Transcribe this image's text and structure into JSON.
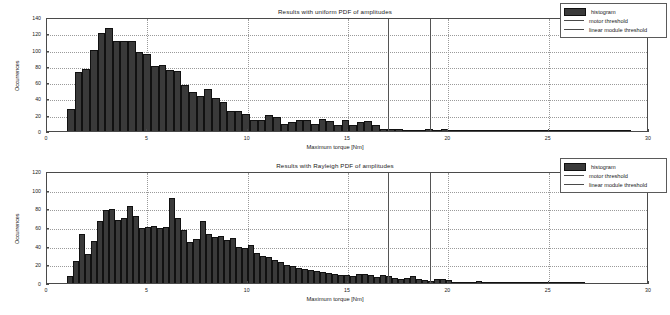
{
  "figure": {
    "background": "#ffffff",
    "bar_color": "#3a3a3a",
    "threshold_color": "#555555",
    "grid_color": "#9a9a9a"
  },
  "charts": [
    {
      "id": "uniform",
      "title": "Results with uniform PDF of amplitudes",
      "xlabel": "Maximum torque [Nm]",
      "ylabel": "Occurrences",
      "xlim": [
        0,
        30
      ],
      "ylim": [
        0,
        140
      ],
      "xticks": [
        0,
        5,
        10,
        15,
        20,
        25,
        30
      ],
      "yticks": [
        0,
        20,
        40,
        60,
        80,
        100,
        120,
        140
      ],
      "grid": true,
      "legend": [
        {
          "label": "histogram",
          "style": "box"
        },
        {
          "label": "motor threshold",
          "style": "line"
        },
        {
          "label": "linear module threshold",
          "style": "line"
        }
      ],
      "thresholds": [
        {
          "name": "motor threshold",
          "value": 17.0
        },
        {
          "name": "linear module threshold",
          "value": 19.1
        }
      ],
      "bin_width": 0.38,
      "bin_start": 1.0,
      "values": [
        27,
        72,
        76,
        99,
        120,
        127,
        111,
        111,
        110,
        97,
        94,
        80,
        81,
        75,
        74,
        57,
        48,
        43,
        51,
        40,
        36,
        25,
        25,
        21,
        14,
        13,
        20,
        17,
        9,
        11,
        14,
        13,
        9,
        15,
        12,
        7,
        13,
        8,
        11,
        12,
        7,
        2,
        2,
        3,
        1,
        1,
        1,
        3,
        1,
        2,
        1,
        1,
        1,
        1,
        1,
        1,
        1,
        1,
        1,
        1,
        1,
        1,
        1,
        1,
        1,
        1,
        1,
        1,
        1,
        1,
        1,
        1,
        1,
        1
      ]
    },
    {
      "id": "rayleigh",
      "title": "Results with Rayleigh PDF of amplitudes",
      "xlabel": "Maximum torque [Nm]",
      "ylabel": "Occurrences",
      "xlim": [
        0,
        30
      ],
      "ylim": [
        0,
        120
      ],
      "xticks": [
        0,
        5,
        10,
        15,
        20,
        25,
        30
      ],
      "yticks": [
        0,
        20,
        40,
        60,
        80,
        100,
        120
      ],
      "grid": true,
      "legend": [
        {
          "label": "histogram",
          "style": "box"
        },
        {
          "label": "motor threshold",
          "style": "line"
        },
        {
          "label": "linear module threshold",
          "style": "line"
        }
      ],
      "thresholds": [
        {
          "name": "motor threshold",
          "value": 17.0
        },
        {
          "name": "linear module threshold",
          "value": 19.1
        }
      ],
      "bin_width": 0.3,
      "bin_start": 1.0,
      "values": [
        7,
        24,
        52,
        31,
        45,
        66,
        78,
        79,
        67,
        70,
        83,
        72,
        59,
        60,
        61,
        59,
        60,
        91,
        70,
        57,
        44,
        47,
        66,
        53,
        49,
        50,
        46,
        48,
        39,
        37,
        41,
        32,
        29,
        28,
        25,
        22,
        19,
        18,
        16,
        15,
        14,
        13,
        12,
        11,
        10,
        9,
        9,
        8,
        10,
        10,
        9,
        6,
        9,
        7,
        5,
        4,
        5,
        7,
        4,
        3,
        2,
        4,
        4,
        3,
        1,
        1,
        1,
        1,
        2,
        1,
        1,
        1,
        1,
        1,
        1,
        1,
        1,
        1,
        1,
        1,
        1,
        1,
        1,
        1,
        1,
        1
      ]
    }
  ]
}
